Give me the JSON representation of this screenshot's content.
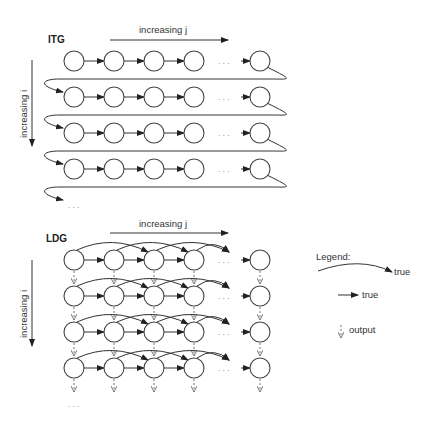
{
  "itg": {
    "title": "ITG",
    "j_axis_label": "increasing j",
    "i_axis_label": "increasing i",
    "rows": 4,
    "cols_shown": 5,
    "ellipsis": "..."
  },
  "ldg": {
    "title": "LDG",
    "j_axis_label": "increasing j",
    "i_axis_label": "increasing i",
    "rows": 4,
    "cols_shown": 5,
    "ellipsis": "..."
  },
  "legend": {
    "title": "Legend:",
    "items": [
      {
        "kind": "curved-arrow",
        "label": "true"
      },
      {
        "kind": "straight-arrow",
        "label": "true"
      },
      {
        "kind": "dashed-output-arrow",
        "label": "output"
      }
    ]
  },
  "colors": {
    "node_stroke": "#444444",
    "edge": "#333333",
    "output_edge": "#666666"
  }
}
